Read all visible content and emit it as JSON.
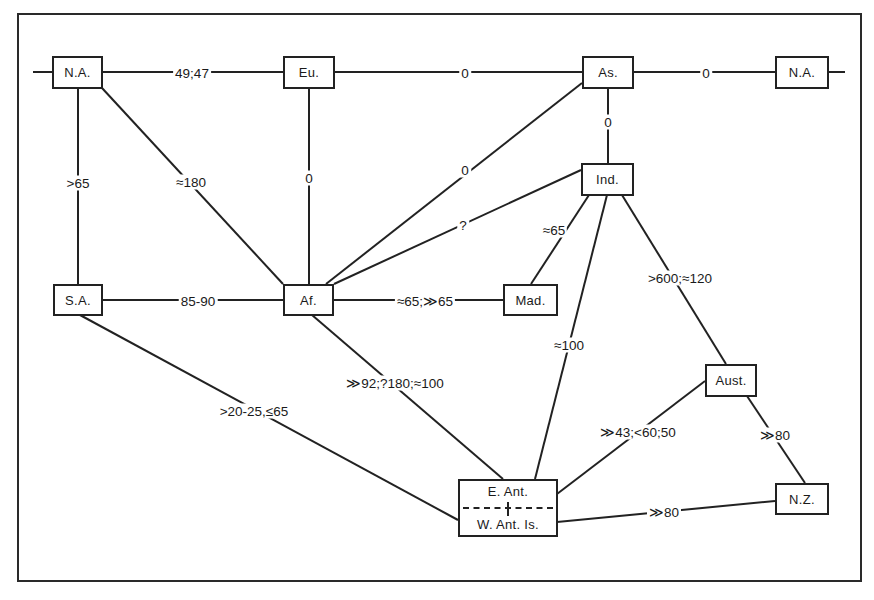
{
  "diagram": {
    "type": "network",
    "nodes": [
      {
        "id": "na_left",
        "label": "N.A."
      },
      {
        "id": "eu",
        "label": "Eu."
      },
      {
        "id": "as",
        "label": "As."
      },
      {
        "id": "na_right",
        "label": "N.A."
      },
      {
        "id": "ind",
        "label": "Ind."
      },
      {
        "id": "sa",
        "label": "S.A."
      },
      {
        "id": "af",
        "label": "Af."
      },
      {
        "id": "mad",
        "label": "Mad."
      },
      {
        "id": "aust",
        "label": "Aust."
      },
      {
        "id": "ant",
        "label_top": "E. Ant.",
        "label_bottom": "W. Ant. Is."
      },
      {
        "id": "nz",
        "label": "N.Z."
      }
    ],
    "edges": [
      {
        "from": "na_left",
        "to": "eu",
        "label": "49;47"
      },
      {
        "from": "eu",
        "to": "as",
        "label": "0"
      },
      {
        "from": "as",
        "to": "na_right",
        "label": "0"
      },
      {
        "from": "as",
        "to": "ind",
        "label": "0"
      },
      {
        "from": "na_left",
        "to": "sa",
        "label": ">65"
      },
      {
        "from": "na_left",
        "to": "af",
        "label": "≈180"
      },
      {
        "from": "eu",
        "to": "af",
        "label": "0"
      },
      {
        "from": "as",
        "to": "af",
        "label": "0"
      },
      {
        "from": "ind",
        "to": "af",
        "label": "?"
      },
      {
        "from": "ind",
        "to": "mad",
        "label": "≈65"
      },
      {
        "from": "sa",
        "to": "af",
        "label": "85-90"
      },
      {
        "from": "af",
        "to": "mad",
        "label": "≈65;≫65"
      },
      {
        "from": "ind",
        "to": "aust",
        "label": ">600;≈120"
      },
      {
        "from": "ind",
        "to": "ant",
        "label": "≈100"
      },
      {
        "from": "af",
        "to": "ant",
        "label": "≫92;?180;≈100"
      },
      {
        "from": "sa",
        "to": "ant",
        "label": ">20-25,≤65"
      },
      {
        "from": "aust",
        "to": "ant",
        "label": "≫43;<60;50"
      },
      {
        "from": "aust",
        "to": "nz",
        "label": "≫80"
      },
      {
        "from": "ant",
        "to": "nz",
        "label": "≫80"
      }
    ]
  }
}
